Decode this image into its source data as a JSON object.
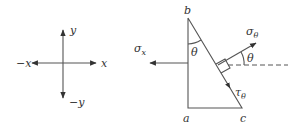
{
  "axes_diagram": {
    "labels": {
      "pos_x": "x",
      "neg_x": "−x",
      "pos_y": "y",
      "neg_y": "−y"
    }
  },
  "element_diagram": {
    "vertices": {
      "top": "b",
      "bottom_left": "a",
      "bottom_right": "c"
    },
    "angle_at_b": "θ",
    "angle_normal": "θ",
    "normal_stress": {
      "symbol": "σ",
      "subscript": "θ"
    },
    "shear_stress": {
      "symbol": "τ",
      "subscript": "θ"
    },
    "x_stress": {
      "symbol": "σ",
      "subscript": "x"
    }
  },
  "colors": {
    "line": "#555555",
    "text": "#333333",
    "background": "#ffffff"
  }
}
